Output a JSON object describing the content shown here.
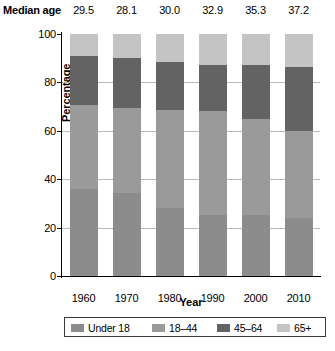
{
  "header": {
    "median_age_label": "Median age",
    "median_ages": [
      "29.5",
      "28.1",
      "30.0",
      "32.9",
      "35.3",
      "37.2"
    ]
  },
  "axes": {
    "ylabel": "Percentage",
    "xlabel": "Year",
    "yticks": [
      "0",
      "20",
      "40",
      "60",
      "80",
      "100"
    ]
  },
  "legend": {
    "items": [
      {
        "label": "Under 18",
        "color": "#8c8c8c"
      },
      {
        "label": "18–44",
        "color": "#9a9a9a"
      },
      {
        "label": "45–64",
        "color": "#636363"
      },
      {
        "label": "65+",
        "color": "#c4c4c4"
      }
    ]
  },
  "chart_data": {
    "type": "bar",
    "title": "",
    "xlabel": "Year",
    "ylabel": "Percentage",
    "ylim": [
      0,
      100
    ],
    "grid": true,
    "legend_position": "bottom",
    "stacked": true,
    "categories": [
      "1960",
      "1970",
      "1980",
      "1990",
      "2000",
      "2010"
    ],
    "median_age": [
      29.5,
      28.1,
      30.0,
      32.9,
      35.3,
      37.2
    ],
    "series": [
      {
        "name": "Under 18",
        "color": "#8c8c8c",
        "values": [
          36.0,
          34.3,
          28.0,
          25.3,
          25.3,
          24.0
        ]
      },
      {
        "name": "18–44",
        "color": "#9a9a9a",
        "values": [
          34.5,
          35.0,
          40.8,
          43.0,
          39.7,
          36.0
        ]
      },
      {
        "name": "45–64",
        "color": "#636363",
        "values": [
          20.3,
          20.7,
          19.5,
          18.7,
          22.0,
          26.3
        ]
      },
      {
        "name": "65+",
        "color": "#c4c4c4",
        "values": [
          9.2,
          10.0,
          11.7,
          13.0,
          13.0,
          13.7
        ]
      }
    ]
  }
}
